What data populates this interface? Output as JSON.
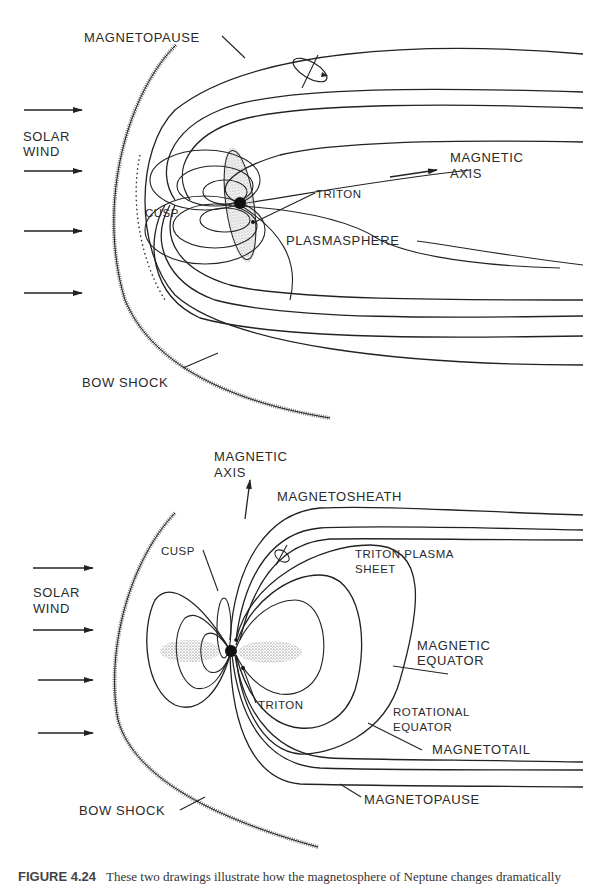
{
  "figure": {
    "number": "FIGURE 4.24",
    "caption_text": "These two drawings illustrate how the magnetosphere of Neptune changes dramatically"
  },
  "top_diagram": {
    "labels": {
      "magnetopause": "MAGNETOPAUSE",
      "solar_wind_line1": "SOLAR",
      "solar_wind_line2": "WIND",
      "magnetic_axis_line1": "MAGNETIC",
      "magnetic_axis_line2": "AXIS",
      "triton": "TRITON",
      "cusp": "CUSP",
      "plasmasphere": "PLASMASPHERE",
      "bow_shock": "BOW SHOCK"
    },
    "solar_wind_arrow_count": 4
  },
  "bottom_diagram": {
    "labels": {
      "magnetic_axis_line1": "MAGNETIC",
      "magnetic_axis_line2": "AXIS",
      "magnetosheath": "MAGNETOSHEATH",
      "cusp": "CUSP",
      "triton_plasma_sheet_line1": "TRITON PLASMA",
      "triton_plasma_sheet_line2": "SHEET",
      "solar_wind_line1": "SOLAR",
      "solar_wind_line2": "WIND",
      "magnetic_equator_line1": "MAGNETIC",
      "magnetic_equator_line2": "EQUATOR",
      "triton": "TRITON",
      "rotational_equator_line1": "ROTATIONAL",
      "rotational_equator_line2": "EQUATOR",
      "magnetotail": "MAGNETOTAIL",
      "bow_shock": "BOW SHOCK",
      "magnetopause": "MAGNETOPAUSE"
    },
    "solar_wind_arrow_count": 4
  }
}
